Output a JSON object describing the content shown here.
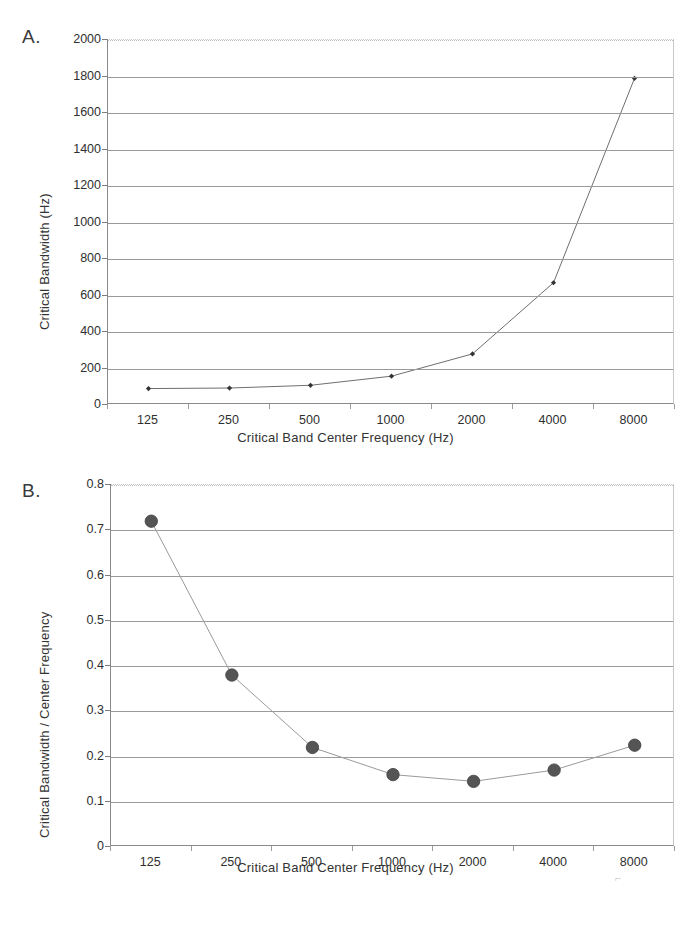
{
  "figure": {
    "panel_a_letter": "A.",
    "panel_b_letter": "B."
  },
  "chart_data": [
    {
      "id": "panel-a",
      "type": "line",
      "title": "",
      "xlabel": "Critical Band Center Frequency (Hz)",
      "ylabel": "Critical Bandwidth (Hz)",
      "categories": [
        "125",
        "250",
        "500",
        "1000",
        "2000",
        "4000",
        "8000"
      ],
      "values": [
        90,
        93,
        108,
        158,
        280,
        670,
        1790
      ],
      "ytick_labels": [
        "2000",
        "1800",
        "1600",
        "1400",
        "1200",
        "1000",
        "800",
        "600",
        "400",
        "200",
        "0"
      ],
      "ytick_values": [
        2000,
        1800,
        1600,
        1400,
        1200,
        1000,
        800,
        600,
        400,
        200,
        0
      ],
      "ylim": [
        0,
        2000
      ],
      "grid": true,
      "legend": "none",
      "marker": "diamond",
      "marker_color": "#333333",
      "line_color": "#6f6f6f"
    },
    {
      "id": "panel-b",
      "type": "line",
      "title": "",
      "xlabel": "Critical Band Center Frequency (Hz)",
      "ylabel": "Critical Bandwidth / Center Frequency",
      "categories": [
        "125",
        "250",
        "500",
        "1000",
        "2000",
        "4000",
        "8000"
      ],
      "values": [
        0.72,
        0.38,
        0.22,
        0.16,
        0.145,
        0.17,
        0.225
      ],
      "ytick_labels": [
        "0.8",
        "0.7",
        "0.6",
        "0.5",
        "0.4",
        "0.3",
        "0.2",
        "0.1",
        "0"
      ],
      "ytick_values": [
        0.8,
        0.7,
        0.6,
        0.5,
        0.4,
        0.3,
        0.2,
        0.1,
        0
      ],
      "ylim": [
        0,
        0.8
      ],
      "grid": true,
      "legend": "none",
      "marker": "circle",
      "marker_color": "#555555",
      "line_color": "#9a9a9a"
    }
  ]
}
